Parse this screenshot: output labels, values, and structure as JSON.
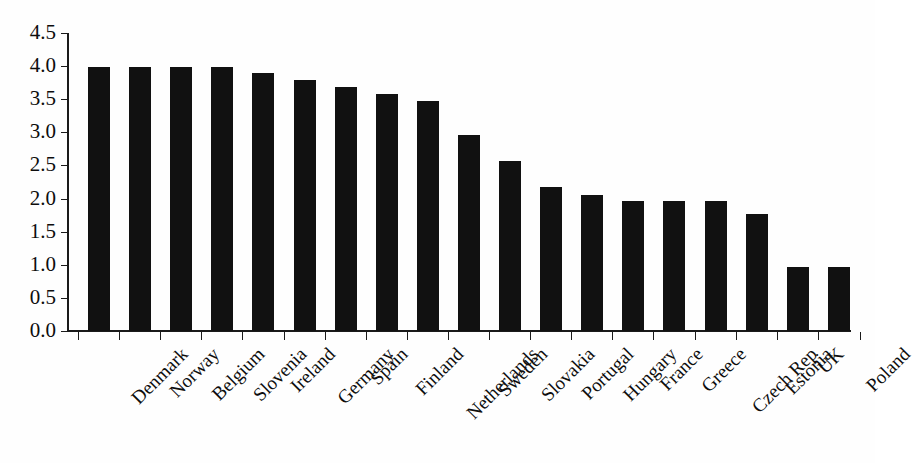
{
  "chart_data": {
    "type": "bar",
    "title": "",
    "subtitle": "",
    "xlabel": "",
    "ylabel": "",
    "ylim": [
      0.0,
      4.5
    ],
    "ytick_step": 0.5,
    "grid": false,
    "legend": null,
    "bar_color": "#111111",
    "background_color": "#ffffff",
    "axis_color": "#1a1a1a",
    "categories": [
      "Denmark",
      "Norway",
      "Belgium",
      "Slovenia",
      "Ireland",
      "Germany",
      "Spain",
      "Finland",
      "Netherlands",
      "Sweden",
      "Slovakia",
      "Portugal",
      "Hungary",
      "France",
      "Greece",
      "Czech Rep",
      "Estonia",
      "UK",
      "Poland"
    ],
    "values": [
      3.99,
      3.99,
      3.99,
      3.99,
      3.89,
      3.79,
      3.68,
      3.58,
      3.47,
      2.96,
      2.56,
      2.17,
      2.06,
      1.96,
      1.96,
      1.96,
      1.76,
      0.96,
      0.96
    ],
    "ytick_labels": [
      "0.0",
      "0.5",
      "1.0",
      "1.5",
      "2.0",
      "2.5",
      "3.0",
      "3.5",
      "4.0",
      "4.5"
    ],
    "ytick_values": [
      0.0,
      0.5,
      1.0,
      1.5,
      2.0,
      2.5,
      3.0,
      3.5,
      4.0,
      4.5
    ]
  }
}
